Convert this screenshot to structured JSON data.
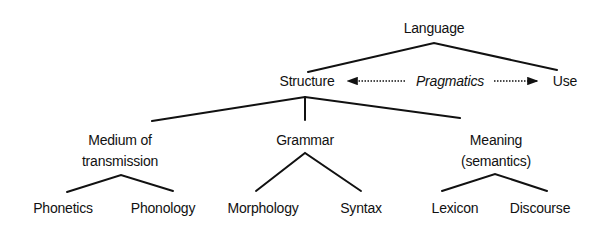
{
  "diagram": {
    "type": "tree",
    "root": {
      "id": "language",
      "label": "Language"
    },
    "nodes": [
      {
        "id": "language",
        "label": "Language"
      },
      {
        "id": "structure",
        "label": "Structure"
      },
      {
        "id": "use",
        "label": "Use"
      },
      {
        "id": "pragmatics",
        "label": "Pragmatics"
      },
      {
        "id": "medium",
        "label_line1": "Medium of",
        "label_line2": "transmission"
      },
      {
        "id": "grammar",
        "label": "Grammar"
      },
      {
        "id": "meaning",
        "label_line1": "Meaning",
        "label_line2": "(semantics)"
      },
      {
        "id": "phonetics",
        "label": "Phonetics"
      },
      {
        "id": "phonology",
        "label": "Phonology"
      },
      {
        "id": "morphology",
        "label": "Morphology"
      },
      {
        "id": "syntax",
        "label": "Syntax"
      },
      {
        "id": "lexicon",
        "label": "Lexicon"
      },
      {
        "id": "discourse",
        "label": "Discourse"
      }
    ],
    "edges": [
      {
        "from": "language",
        "to": "structure"
      },
      {
        "from": "language",
        "to": "use"
      },
      {
        "from": "structure",
        "to": "medium"
      },
      {
        "from": "structure",
        "to": "grammar"
      },
      {
        "from": "structure",
        "to": "meaning"
      },
      {
        "from": "medium",
        "to": "phonetics"
      },
      {
        "from": "medium",
        "to": "phonology"
      },
      {
        "from": "grammar",
        "to": "morphology"
      },
      {
        "from": "grammar",
        "to": "syntax"
      },
      {
        "from": "meaning",
        "to": "lexicon"
      },
      {
        "from": "meaning",
        "to": "discourse"
      }
    ],
    "relations": [
      {
        "from": "pragmatics",
        "to": "structure",
        "style": "dotted-arrow"
      },
      {
        "from": "pragmatics",
        "to": "use",
        "style": "dotted-arrow"
      }
    ],
    "colors": {
      "line": "#111111",
      "text": "#111111",
      "background": "#ffffff"
    }
  }
}
